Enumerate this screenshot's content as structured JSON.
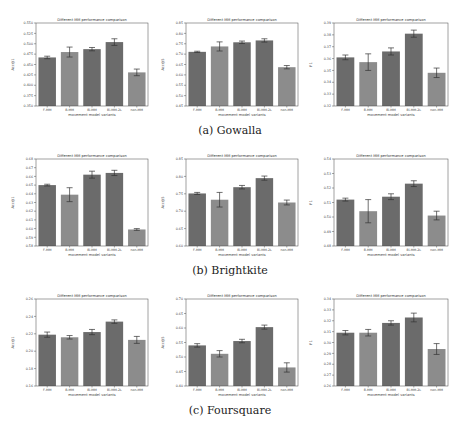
{
  "figure": {
    "captions": [
      "(a) Gowalla",
      "(b) Brightkite",
      "(c) Foursquare"
    ]
  },
  "colors": {
    "bar_dark": "#6b6b6b",
    "bar_light": "#8c8c8c",
    "error": "#333333",
    "axis": "#222222",
    "frame": "#444444"
  },
  "chart_data": [
    {
      "id": "gowalla-acc1",
      "dataset": "Gowalla",
      "type": "bar",
      "title": "Different MM performance comparison",
      "xlabel": "movement model variants",
      "ylabel": "Acc@1",
      "categories": [
        "F-MM",
        "B-MM",
        "Bi-MM",
        "Bi-MM-2L",
        "non-MM"
      ],
      "values": [
        0.467,
        0.48,
        0.487,
        0.504,
        0.431
      ],
      "errors": [
        0.003,
        0.012,
        0.004,
        0.008,
        0.008
      ],
      "ylim": [
        0.35,
        0.55
      ],
      "yticks": [
        "0.350",
        "0.375",
        "0.400",
        "0.425",
        "0.450",
        "0.475",
        "0.500",
        "0.525",
        "0.550"
      ]
    },
    {
      "id": "gowalla-acc5",
      "dataset": "Gowalla",
      "type": "bar",
      "title": "Different MM performance comparison",
      "xlabel": "movement model variants",
      "ylabel": "Acc@5",
      "categories": [
        "F-MM",
        "B-MM",
        "Bi-MM",
        "Bi-MM-2L",
        "non-MM"
      ],
      "values": [
        0.711,
        0.737,
        0.757,
        0.766,
        0.637
      ],
      "errors": [
        0.003,
        0.022,
        0.006,
        0.008,
        0.008
      ],
      "ylim": [
        0.45,
        0.85
      ],
      "yticks": [
        "0.45",
        "0.50",
        "0.55",
        "0.60",
        "0.65",
        "0.70",
        "0.75",
        "0.80",
        "0.85"
      ]
    },
    {
      "id": "gowalla-f1",
      "dataset": "Gowalla",
      "type": "bar",
      "title": "Different MM performance comparison",
      "xlabel": "movement model variants",
      "ylabel": "F1",
      "categories": [
        "F-MM",
        "B-MM",
        "Bi-MM",
        "Bi-MM-2L",
        "non-MM"
      ],
      "values": [
        0.361,
        0.357,
        0.366,
        0.381,
        0.348
      ],
      "errors": [
        0.002,
        0.007,
        0.003,
        0.003,
        0.004
      ],
      "ylim": [
        0.32,
        0.39
      ],
      "yticks": [
        "0.32",
        "0.33",
        "0.34",
        "0.35",
        "0.36",
        "0.37",
        "0.38",
        "0.39"
      ]
    },
    {
      "id": "brightkite-acc1",
      "dataset": "Brightkite",
      "type": "bar",
      "title": "Different MM performance comparison",
      "xlabel": "movement model variants",
      "ylabel": "Acc@1",
      "categories": [
        "F-MM",
        "B-MM",
        "Bi-MM",
        "Bi-MM-2L",
        "non-MM"
      ],
      "values": [
        0.65,
        0.639,
        0.662,
        0.664,
        0.599
      ],
      "errors": [
        0.001,
        0.008,
        0.004,
        0.003,
        0.001
      ],
      "ylim": [
        0.58,
        0.68
      ],
      "yticks": [
        "0.58",
        "0.59",
        "0.60",
        "0.61",
        "0.62",
        "0.63",
        "0.64",
        "0.65",
        "0.66",
        "0.67",
        "0.68"
      ]
    },
    {
      "id": "brightkite-acc5",
      "dataset": "Brightkite",
      "type": "bar",
      "title": "Different MM performance comparison",
      "xlabel": "movement model variants",
      "ylabel": "Acc@5",
      "categories": [
        "F-MM",
        "B-MM",
        "Bi-MM",
        "Bi-MM-2L",
        "non-MM"
      ],
      "values": [
        0.751,
        0.733,
        0.769,
        0.795,
        0.725
      ],
      "errors": [
        0.003,
        0.021,
        0.005,
        0.006,
        0.007
      ],
      "ylim": [
        0.6,
        0.85
      ],
      "yticks": [
        "0.60",
        "0.65",
        "0.70",
        "0.75",
        "0.80",
        "0.85"
      ]
    },
    {
      "id": "brightkite-f1",
      "dataset": "Brightkite",
      "type": "bar",
      "title": "Different MM performance comparison",
      "xlabel": "movement model variants",
      "ylabel": "F1",
      "categories": [
        "F-MM",
        "B-MM",
        "Bi-MM",
        "Bi-MM-2L",
        "non-MM"
      ],
      "values": [
        0.512,
        0.504,
        0.514,
        0.523,
        0.501
      ],
      "errors": [
        0.001,
        0.008,
        0.002,
        0.002,
        0.003
      ],
      "ylim": [
        0.48,
        0.54
      ],
      "yticks": [
        "0.48",
        "0.49",
        "0.50",
        "0.51",
        "0.52",
        "0.53",
        "0.54"
      ]
    },
    {
      "id": "foursquare-acc1",
      "dataset": "Foursquare",
      "type": "bar",
      "title": "Different MM performance comparison",
      "xlabel": "movement model variants",
      "ylabel": "Acc@1",
      "categories": [
        "F-MM",
        "B-MM",
        "Bi-MM",
        "Bi-MM-2L",
        "non-MM"
      ],
      "values": [
        0.219,
        0.216,
        0.222,
        0.234,
        0.213
      ],
      "errors": [
        0.003,
        0.002,
        0.003,
        0.002,
        0.004
      ],
      "ylim": [
        0.16,
        0.26
      ],
      "yticks": [
        "0.16",
        "0.18",
        "0.20",
        "0.22",
        "0.24",
        "0.26"
      ]
    },
    {
      "id": "foursquare-acc5",
      "dataset": "Foursquare",
      "type": "bar",
      "title": "Different MM performance comparison",
      "xlabel": "movement model variants",
      "ylabel": "Acc@5",
      "categories": [
        "F-MM",
        "B-MM",
        "Bi-MM",
        "Bi-MM-2L",
        "non-MM"
      ],
      "values": [
        0.54,
        0.511,
        0.555,
        0.603,
        0.464
      ],
      "errors": [
        0.006,
        0.011,
        0.006,
        0.007,
        0.016
      ],
      "ylim": [
        0.4,
        0.7
      ],
      "yticks": [
        "0.40",
        "0.45",
        "0.50",
        "0.55",
        "0.60",
        "0.65",
        "0.70"
      ]
    },
    {
      "id": "foursquare-f1",
      "dataset": "Foursquare",
      "type": "bar",
      "title": "Different MM performance comparison",
      "xlabel": "movement model variants",
      "ylabel": "F1",
      "categories": [
        "F-MM",
        "B-MM",
        "Bi-MM",
        "Bi-MM-2L",
        "non-MM"
      ],
      "values": [
        0.309,
        0.309,
        0.318,
        0.323,
        0.294
      ],
      "errors": [
        0.002,
        0.003,
        0.002,
        0.004,
        0.005
      ],
      "ylim": [
        0.26,
        0.34
      ],
      "yticks": [
        "0.26",
        "0.27",
        "0.28",
        "0.29",
        "0.30",
        "0.31",
        "0.32",
        "0.33",
        "0.34"
      ]
    }
  ]
}
